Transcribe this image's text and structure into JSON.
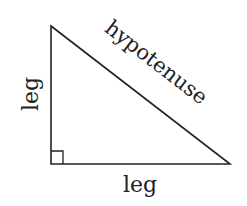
{
  "diagram": {
    "labels": {
      "vertical_leg": "leg",
      "horizontal_leg": "leg",
      "hypotenuse": "hypotenuse"
    },
    "right_angle_marker": true,
    "stroke_color": "#222222"
  }
}
